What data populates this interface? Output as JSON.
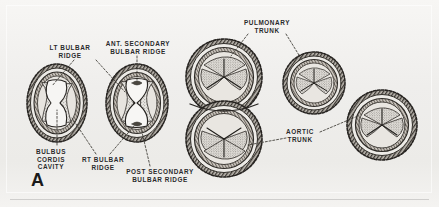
{
  "figure": {
    "panel_letter": "A",
    "background_color": "#f2f1ef",
    "ink_color": "#2a2a2a",
    "labels": [
      {
        "id": "lt-bulbar-ridge",
        "text": "LT BULBAR\nRIDGE",
        "x": 58,
        "y": 44
      },
      {
        "id": "ant-secondary-ridge",
        "text": "ANT. SECONDARY\nBULBAR RIDGE",
        "x": 110,
        "y": 40
      },
      {
        "id": "pulmonary-trunk",
        "text": "PULMONARY\nTRUNK",
        "x": 246,
        "y": 19
      },
      {
        "id": "bulbus-cordis-cavity",
        "text": "BULBUS\nCORDIS\nCAVITY",
        "x": 26,
        "y": 148
      },
      {
        "id": "rt-bulbar-ridge",
        "text": "RT BULBAR\nRIDGE",
        "x": 82,
        "y": 156
      },
      {
        "id": "post-secondary-ridge",
        "text": "POST SECONDARY\nBULBAR RIDGE",
        "x": 127,
        "y": 168
      },
      {
        "id": "aortic-trunk",
        "text": "AORTIC\nTRUNK",
        "x": 288,
        "y": 128
      }
    ],
    "specimens": [
      {
        "id": "specimen-1-bulbus-oval",
        "shape": "oval",
        "cx": 57,
        "cy": 103
      },
      {
        "id": "specimen-2-ridges-fusing",
        "shape": "oval",
        "cx": 137,
        "cy": 103
      },
      {
        "id": "specimen-3-figure-eight",
        "shape": "figure-8",
        "cx": 224,
        "cy": 105
      },
      {
        "id": "specimen-4-pulmonary-trunk",
        "shape": "circle",
        "cx": 314,
        "cy": 83
      },
      {
        "id": "specimen-5-aortic-trunk",
        "shape": "circle",
        "cx": 382,
        "cy": 125
      }
    ]
  }
}
